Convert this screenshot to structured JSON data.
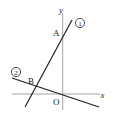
{
  "diagram": {
    "type": "coordinate-plane-lines",
    "axes": {
      "x_label": "x",
      "y_label": "y",
      "origin_label": "O"
    },
    "lines": [
      {
        "id": "line-1",
        "label": "①",
        "description": "steep positive slope, passes through A on y-axis"
      },
      {
        "id": "line-2",
        "label": "②",
        "description": "negative slope, passes through origin O"
      }
    ],
    "points": [
      {
        "label": "A",
        "description": "intersection of line ① with the y-axis"
      },
      {
        "label": "B",
        "description": "intersection of lines ① and ②"
      },
      {
        "label": "O",
        "description": "origin"
      }
    ]
  }
}
